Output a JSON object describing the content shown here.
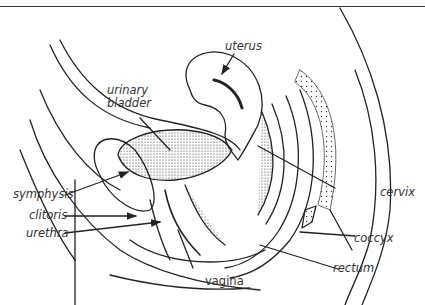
{
  "figure": {
    "labels": {
      "uterus": "uterus",
      "urinary_bladder_1": "urinary",
      "urinary_bladder_2": "bladder",
      "symphysis": "symphysis",
      "clitoris": "clitoris",
      "urethra": "urethra",
      "vagina": "vagina",
      "cervix": "cervix",
      "coccyx": "coccyx",
      "rectum": "rectum"
    },
    "colors": {
      "line": "#222222",
      "text": "#333333",
      "background": "#ffffff"
    }
  }
}
